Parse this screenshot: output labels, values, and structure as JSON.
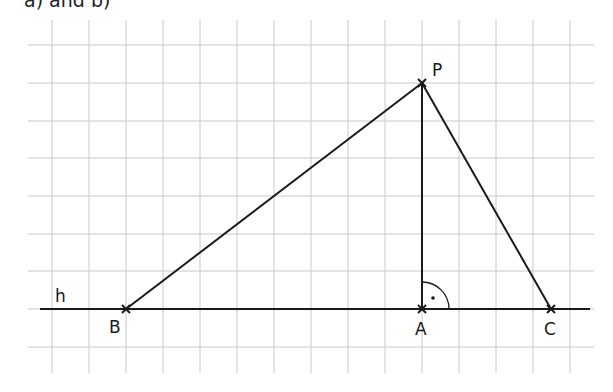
{
  "heading": "a) and b)",
  "grid": {
    "vertical_x": [
      52,
      89,
      126,
      163,
      200,
      237,
      274,
      311,
      348,
      385,
      422,
      459,
      496,
      533,
      570
    ],
    "vertical_y_range": [
      20,
      373
    ],
    "horizontal_y": [
      45,
      83,
      121,
      158,
      196,
      234,
      271,
      309,
      347
    ],
    "horizontal_x_range": [
      28,
      594
    ],
    "color": "#c8c8c8"
  },
  "line_h": {
    "label": "h",
    "x1": 40,
    "x2": 590,
    "y": 309
  },
  "points": {
    "P": {
      "label": "P",
      "x": 422,
      "y": 83
    },
    "B": {
      "label": "B",
      "x": 126,
      "y": 309
    },
    "A": {
      "label": "A",
      "x": 422,
      "y": 309
    },
    "C": {
      "label": "C",
      "x": 551,
      "y": 309
    }
  },
  "right_angle": {
    "at": "A",
    "radius": 27,
    "dot": [
      433,
      298
    ]
  },
  "stroke_color": "#1a1a1a"
}
